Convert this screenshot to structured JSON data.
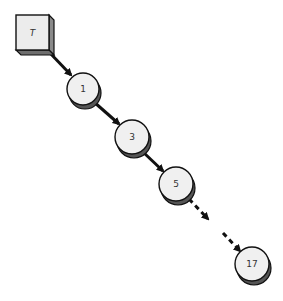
{
  "diagram": {
    "type": "linked-chain",
    "root": {
      "label": "T",
      "shape": "3d-box"
    },
    "nodes": [
      {
        "label": "1"
      },
      {
        "label": "3"
      },
      {
        "label": "5"
      },
      {
        "label": "17"
      }
    ],
    "edges": [
      {
        "from": "T",
        "to": "1",
        "style": "solid-arrow"
      },
      {
        "from": "1",
        "to": "3",
        "style": "solid-arrow"
      },
      {
        "from": "3",
        "to": "5",
        "style": "solid-arrow"
      },
      {
        "from": "5",
        "to": "17",
        "style": "dashed-arrow"
      }
    ],
    "colors": {
      "node_fill": "#f0f0f0",
      "node_shadow": "#555555",
      "outline": "#111111",
      "box_fill": "#ececec",
      "box_side": "#8a8a8a"
    }
  }
}
